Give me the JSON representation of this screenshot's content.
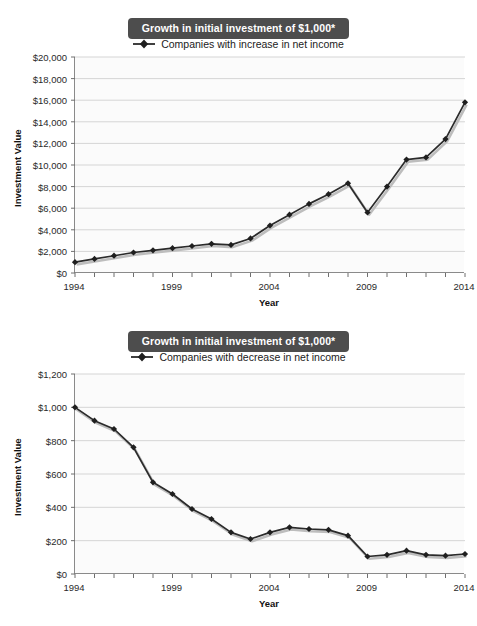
{
  "charts": [
    {
      "id": "increase",
      "title": "Growth in initial investment of $1,000*",
      "legend_label": "Companies with increase in net income",
      "ylabel": "Investment Value",
      "xlabel": "Year",
      "ytick_labels": [
        "$0",
        "$2,000",
        "$4,000",
        "$6,000",
        "$8,000",
        "$10,000",
        "$12,000",
        "$14,000",
        "$16,000",
        "$18,000",
        "$20,000"
      ],
      "xtick_labels": [
        "1994",
        "1999",
        "2004",
        "2009",
        "2014"
      ],
      "chart_data": {
        "type": "line",
        "title": "Growth in initial investment of $1,000*",
        "xlabel": "Year",
        "ylabel": "Investment Value",
        "xlim": [
          1994,
          2014
        ],
        "ylim": [
          0,
          20000
        ],
        "ytick_values": [
          0,
          2000,
          4000,
          6000,
          8000,
          10000,
          12000,
          14000,
          16000,
          18000,
          20000
        ],
        "xtick_values": [
          1994,
          1999,
          2004,
          2009,
          2014
        ],
        "grid": true,
        "legend_position": "top-center",
        "series": [
          {
            "name": "Companies with increase in net income",
            "x": [
              1994,
              1995,
              1996,
              1997,
              1998,
              1999,
              2000,
              2001,
              2002,
              2003,
              2004,
              2005,
              2006,
              2007,
              2008,
              2009,
              2010,
              2011,
              2012,
              2013,
              2014
            ],
            "values": [
              1000,
              1300,
              1600,
              1900,
              2100,
              2300,
              2500,
              2700,
              2600,
              3200,
              4400,
              5400,
              6400,
              7300,
              8300,
              5600,
              8000,
              10500,
              10700,
              12400,
              15800
            ]
          }
        ],
        "annotations": [
          "Marker series with light gray drop shadow under the line"
        ]
      }
    },
    {
      "id": "decrease",
      "title": "Growth in initial investment of $1,000*",
      "legend_label": "Companies with decrease in net income",
      "ylabel": "Investment Value",
      "xlabel": "Year",
      "ytick_labels": [
        "$0",
        "$200",
        "$400",
        "$600",
        "$800",
        "$1,000",
        "$1,200"
      ],
      "xtick_labels": [
        "1994",
        "1999",
        "2004",
        "2009",
        "2014"
      ],
      "chart_data": {
        "type": "line",
        "title": "Growth in initial investment of $1,000*",
        "xlabel": "Year",
        "ylabel": "Investment Value",
        "xlim": [
          1994,
          2014
        ],
        "ylim": [
          0,
          1200
        ],
        "ytick_values": [
          0,
          200,
          400,
          600,
          800,
          1000,
          1200
        ],
        "xtick_values": [
          1994,
          1999,
          2004,
          2009,
          2014
        ],
        "grid": true,
        "legend_position": "top-center",
        "series": [
          {
            "name": "Companies with decrease in net income",
            "x": [
              1994,
              1995,
              1996,
              1997,
              1998,
              1999,
              2000,
              2001,
              2002,
              2003,
              2004,
              2005,
              2006,
              2007,
              2008,
              2009,
              2010,
              2011,
              2012,
              2013,
              2014
            ],
            "values": [
              1000,
              920,
              870,
              760,
              550,
              480,
              390,
              330,
              250,
              210,
              250,
              280,
              270,
              265,
              230,
              105,
              115,
              140,
              115,
              110,
              120
            ]
          }
        ],
        "annotations": [
          "Marker series with light gray drop shadow under the line"
        ]
      }
    }
  ],
  "icons": {
    "legend_marker": "diamond-line-marker"
  }
}
